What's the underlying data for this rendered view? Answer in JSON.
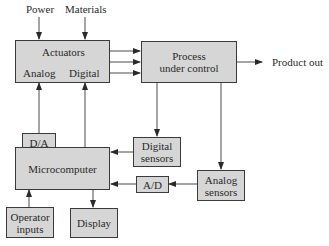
{
  "diagram": {
    "inputs": {
      "power": "Power",
      "materials": "Materials"
    },
    "blocks": {
      "actuators": {
        "title": "Actuators",
        "analog": "Analog",
        "digital": "Digital"
      },
      "process": {
        "line1": "Process",
        "line2": "under control"
      },
      "da": "D/A",
      "microcomputer": "Microcomputer",
      "digital_sensors": {
        "line1": "Digital",
        "line2": "sensors"
      },
      "ad": "A/D",
      "analog_sensors": {
        "line1": "Analog",
        "line2": "sensors"
      },
      "operator_inputs": {
        "line1": "Operator",
        "line2": "inputs"
      },
      "display": "Display"
    },
    "outputs": {
      "product_out": "Product out"
    },
    "colors": {
      "block_fill": "#d6d6d6",
      "block_border": "#3a3a3a",
      "line": "#3a3a3a"
    }
  }
}
